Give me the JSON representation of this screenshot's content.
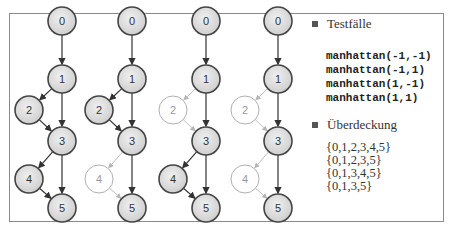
{
  "figure": {
    "node_ids": [
      "0",
      "1",
      "2",
      "3",
      "4",
      "5"
    ],
    "graphs": [
      {
        "coverage_index": 0,
        "visited": [
          "0",
          "1",
          "2",
          "3",
          "4",
          "5"
        ],
        "inactive": []
      },
      {
        "coverage_index": 1,
        "visited": [
          "0",
          "1",
          "2",
          "3",
          "5"
        ],
        "inactive": [
          "4"
        ]
      },
      {
        "coverage_index": 2,
        "visited": [
          "0",
          "1",
          "3",
          "4",
          "5"
        ],
        "inactive": [
          "2"
        ]
      },
      {
        "coverage_index": 3,
        "visited": [
          "0",
          "1",
          "3",
          "5"
        ],
        "inactive": [
          "2",
          "4"
        ]
      }
    ],
    "edges": [
      [
        "0",
        "1"
      ],
      [
        "1",
        "2"
      ],
      [
        "1",
        "3"
      ],
      [
        "2",
        "3"
      ],
      [
        "3",
        "4"
      ],
      [
        "3",
        "5"
      ],
      [
        "4",
        "5"
      ]
    ],
    "colors": {
      "node_fill": "#dcdcdc",
      "node_stroke": "#444444",
      "inactive_stroke": "#b0b0b0",
      "active_edge": "#333333",
      "inactive_edge": "#b5b5b5"
    }
  },
  "legend": {
    "testcases_label": "Testfälle",
    "testcases": [
      "manhattan(-1,-1)",
      "manhattan(-1,1)",
      "manhattan(1,-1)",
      "manhattan(1,1)"
    ],
    "coverage_label": "Überdeckung",
    "coverage": [
      "{0,1,2,3,4,5}",
      "{0,1,2,3,5}",
      "{0,1,3,4,5}",
      "{0,1,3,5}"
    ]
  }
}
